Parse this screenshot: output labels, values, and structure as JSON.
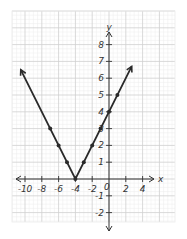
{
  "chart_data": {
    "type": "line",
    "title": "",
    "function": "y = |x + 4|",
    "xlabel": "x",
    "ylabel": "y",
    "xlim": [
      -11.5,
      7.8
    ],
    "ylim": [
      -2.6,
      10
    ],
    "grid": true,
    "legend": null,
    "x_ticks": [
      -10,
      -8,
      -6,
      -4,
      -2,
      0,
      2,
      4
    ],
    "x_tick_labels": [
      "-10",
      "-8",
      "-6",
      "-4",
      "-2",
      "0",
      "2",
      "4"
    ],
    "y_ticks": [
      -2,
      -1,
      1,
      2,
      3,
      4,
      5,
      6,
      7,
      8
    ],
    "y_tick_labels": [
      "-2",
      "-1",
      "1",
      "2",
      "3",
      "4",
      "5",
      "6",
      "7",
      "8"
    ],
    "series": [
      {
        "name": "y = |x+4|",
        "line": {
          "x": [
            -10.5,
            -4,
            2.7
          ],
          "y": [
            6.5,
            0,
            6.7
          ]
        },
        "arrows": "both ends",
        "points": {
          "x": [
            -7,
            -6,
            -5,
            -4,
            -3,
            -2,
            -1,
            0,
            1
          ],
          "y": [
            3,
            2,
            1,
            0,
            1,
            2,
            3,
            4,
            5
          ]
        },
        "color": "#2a2a2a"
      }
    ]
  },
  "colors": {
    "minor_grid": "#ececec",
    "major_grid": "#cfcfcf",
    "axis": "#333333",
    "line": "#2a2a2a"
  }
}
